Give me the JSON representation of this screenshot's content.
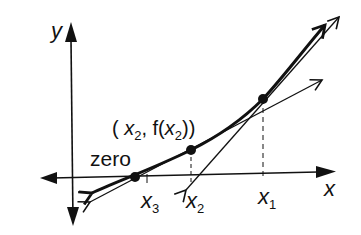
{
  "diagram": {
    "type": "newton-method-illustration",
    "axes": {
      "x_label": "x",
      "y_label": "y"
    },
    "labels": {
      "zero": "zero",
      "point_label_open": "( ",
      "point_label_x": "x",
      "point_label_x_sub": "2",
      "point_label_mid": ", f(",
      "point_label_x2": "x",
      "point_label_x2_sub": "2",
      "point_label_close": "))",
      "x1": "x",
      "x1_sub": "1",
      "x2": "x",
      "x2_sub": "2",
      "x3": "x",
      "x3_sub": "3"
    },
    "points": [
      {
        "name": "zero",
        "px": [
          135,
          177
        ]
      },
      {
        "name": "x2-point",
        "px": [
          191,
          150
        ]
      },
      {
        "name": "x1-point",
        "px": [
          263,
          99
        ]
      }
    ],
    "colors": {
      "ink": "#111111",
      "background": "#ffffff"
    }
  }
}
